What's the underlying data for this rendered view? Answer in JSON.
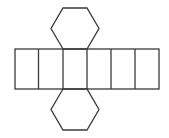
{
  "diagram": {
    "stroke_color": "#3a3a3a",
    "background": "#ffffff",
    "stroke_width": 1.3,
    "strip": {
      "x": 15,
      "y": 49,
      "width": 144,
      "height": 40,
      "dividers": [
        38.5,
        63,
        87,
        111,
        135
      ]
    },
    "top_hexagon": "63,49 51,28.5 63,8 87,8 99,28.5 87,49",
    "bottom_hexagon": "63,89 51,109.5 63,130 87,130 99,109.5 87,89"
  }
}
